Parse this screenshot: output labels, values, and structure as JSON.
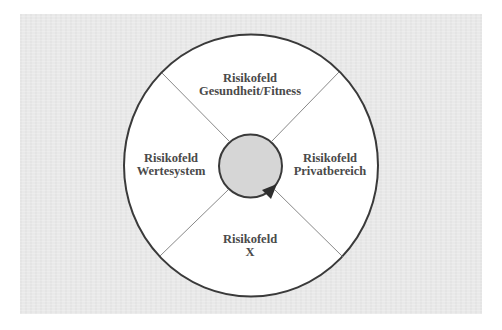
{
  "diagram": {
    "type": "segmented-circle",
    "colors": {
      "background": "#e9e9e9",
      "outer_fill": "#ffffff",
      "outline": "#3a3a3a",
      "divider": "#7a7a7a",
      "center_fill": "#d6d6d6",
      "arrow": "#2e2e2e",
      "text": "#4a4a4a"
    },
    "segments": [
      {
        "position": "top",
        "line1": "Risikofeld",
        "line2": "Gesundheit/Fitness"
      },
      {
        "position": "left",
        "line1": "Risikofeld",
        "line2": "Wertesystem"
      },
      {
        "position": "right",
        "line1": "Risikofeld",
        "line2": "Privatbereich"
      },
      {
        "position": "bottom",
        "line1": "Risikofeld",
        "line2": "X"
      }
    ],
    "center": {
      "icon": "rotation-arrow-icon"
    }
  }
}
